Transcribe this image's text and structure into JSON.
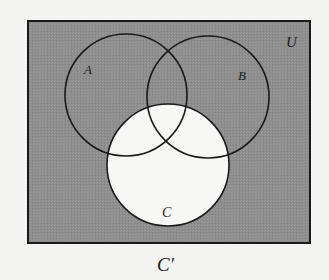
{
  "diagram": {
    "type": "venn",
    "universe": {
      "label": "U",
      "x": 28,
      "y": 21,
      "width": 282,
      "height": 222,
      "fill": "#8e8e8e",
      "stroke": "#1a1a1a"
    },
    "sets": [
      {
        "name": "A",
        "label": "A",
        "cx": 126,
        "cy": 95,
        "r": 61,
        "label_x": 88,
        "label_y": 74,
        "shaded": true
      },
      {
        "name": "B",
        "label": "B",
        "cx": 208,
        "cy": 97,
        "r": 61,
        "label_x": 243,
        "label_y": 80,
        "shaded": true
      },
      {
        "name": "C",
        "label": "C",
        "cx": 168,
        "cy": 165,
        "r": 61,
        "label_x": 168,
        "label_y": 217,
        "shaded": false,
        "fill": "#f7f7f5"
      }
    ],
    "shaded_region": "C'",
    "caption": "C′",
    "background": "#f4f4f2",
    "stroke_color": "#1a1a1a"
  }
}
